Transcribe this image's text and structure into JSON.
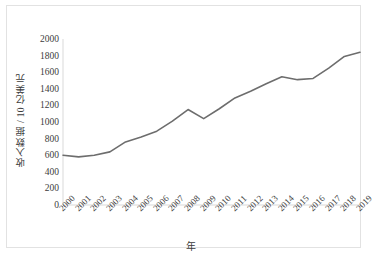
{
  "chart_data": {
    "type": "line",
    "title": "",
    "xlabel": "年",
    "ylabel": "收入数据 / 10 亿美元",
    "categories": [
      "2000",
      "2001",
      "2002",
      "2003",
      "2004",
      "2005",
      "2006",
      "2007",
      "2008",
      "2009",
      "2010",
      "2011",
      "2012",
      "2013",
      "2014",
      "2015",
      "2016",
      "2017",
      "2018",
      "2019"
    ],
    "values": [
      600,
      580,
      600,
      640,
      760,
      820,
      890,
      1010,
      1150,
      1040,
      1160,
      1290,
      1370,
      1460,
      1545,
      1510,
      1525,
      1650,
      1790,
      1840
    ],
    "series": [
      {
        "name": "收入数据",
        "values": [
          600,
          580,
          600,
          640,
          760,
          820,
          890,
          1010,
          1150,
          1040,
          1160,
          1290,
          1370,
          1460,
          1545,
          1510,
          1525,
          1650,
          1790,
          1840
        ]
      }
    ],
    "ylim": [
      0,
      2000
    ],
    "ytick_values": [
      2000,
      1800,
      1600,
      1400,
      1200,
      1000,
      800,
      600,
      400,
      200,
      0
    ],
    "ytick_labels": [
      "2000",
      "1800",
      "1600",
      "1400",
      "1200",
      "1000",
      "800",
      "600",
      "400",
      "200",
      "0"
    ],
    "ystep": 200,
    "xlim": [
      "2000",
      "2019"
    ],
    "grid": false,
    "legend": false,
    "legend_position": "none",
    "line_color": "#6d6d6d",
    "axis_color": "#d9d9d9",
    "border_color": "#e2e2e2",
    "background_color": "#ffffff",
    "xtick_rotation": -45
  }
}
